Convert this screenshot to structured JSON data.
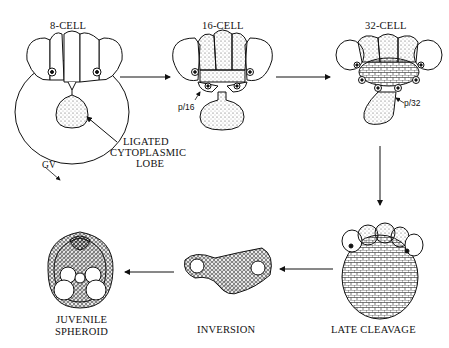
{
  "figure": {
    "stages": [
      {
        "id": "8-cell",
        "label": "8-CELL"
      },
      {
        "id": "16-cell",
        "label": "16-CELL"
      },
      {
        "id": "32-cell",
        "label": "32-CELL"
      },
      {
        "id": "late-cleavage",
        "label": "LATE CLEAVAGE"
      },
      {
        "id": "inversion",
        "label": "INVERSION"
      },
      {
        "id": "juvenile-spheroid",
        "label_line1": "JUVENILE",
        "label_line2": "SPHEROID"
      }
    ],
    "annotations": {
      "ligated_line1": "LIGATED",
      "ligated_line2": "CYTOPLASMIC",
      "ligated_line3": "LOBE",
      "gv": "GV",
      "p16": "p/16",
      "p32": "p/32"
    },
    "flow": [
      "8-CELL",
      "16-CELL",
      "32-CELL",
      "LATE CLEAVAGE",
      "INVERSION",
      "JUVENILE SPHEROID"
    ]
  }
}
